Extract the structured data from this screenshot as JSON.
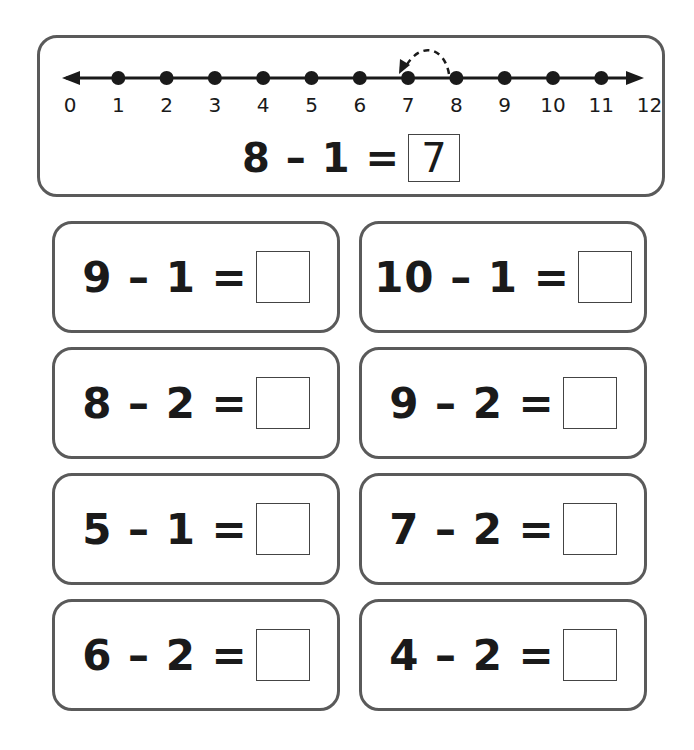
{
  "example": {
    "number_line": {
      "labels": [
        "0",
        "1",
        "2",
        "3",
        "4",
        "5",
        "6",
        "7",
        "8",
        "9",
        "10",
        "11",
        "12"
      ],
      "dots": [
        1,
        2,
        3,
        4,
        5,
        6,
        7,
        8,
        9,
        10,
        11
      ],
      "hop": {
        "from": 8,
        "to": 7,
        "style": "dashed-arc-arrow"
      }
    },
    "equation": "8 – 1 =",
    "answer": "7"
  },
  "problems": [
    {
      "equation": "9 – 1 =",
      "answer": ""
    },
    {
      "equation": "10 – 1 =",
      "answer": ""
    },
    {
      "equation": "8 – 2 =",
      "answer": ""
    },
    {
      "equation": "9 – 2 =",
      "answer": ""
    },
    {
      "equation": "5 – 1 =",
      "answer": ""
    },
    {
      "equation": "7 – 2 =",
      "answer": ""
    },
    {
      "equation": "6 – 2 =",
      "answer": ""
    },
    {
      "equation": "4 – 2 =",
      "answer": ""
    }
  ],
  "colors": {
    "border": "#5a5a5a",
    "ink": "#1a1a1a",
    "background": "#ffffff"
  }
}
